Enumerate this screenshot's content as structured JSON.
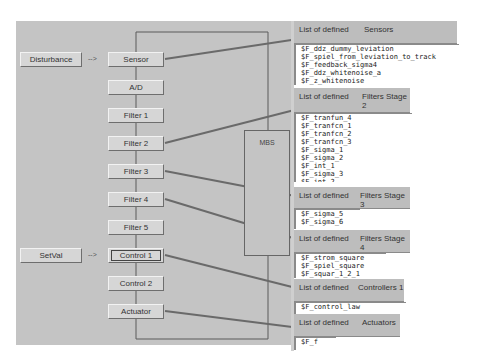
{
  "left_inputs": [
    {
      "label": "Disturbance",
      "arrow": "-->",
      "row": 0
    },
    {
      "label": "SetVal",
      "arrow": "-->",
      "row": 7
    }
  ],
  "chain": [
    {
      "label": "Sensor"
    },
    {
      "label": "A/D"
    },
    {
      "label": "Filter 1"
    },
    {
      "label": "Filter 2"
    },
    {
      "label": "Filter 3"
    },
    {
      "label": "Filter 4"
    },
    {
      "label": "Filter 5"
    },
    {
      "label": "Control 1",
      "focused": true
    },
    {
      "label": "Control 2"
    },
    {
      "label": "Actuator"
    }
  ],
  "mbs": {
    "label": "MBS"
  },
  "panels": [
    {
      "prefix": "List of defined",
      "category": "Sensors",
      "items": [
        "$F_ddz_dummy_leviation",
        "$F_spiel_from_leviation_to_track",
        "$F_feedback_sigma4",
        "$F_ddz_whitenoise_a",
        "$F_z_whitenoise"
      ]
    },
    {
      "prefix": "List of defined",
      "category": "Filters Stage 2",
      "items": [
        "$F_tranfun_4",
        "$F_tranfcn_1",
        "$F_tranfcn_2",
        "$F_tranfcn_3",
        "$F_sigma_1",
        "$F_sigma_2",
        "$F_int_1",
        "$F_sigma_3",
        "$F_int_2"
      ]
    },
    {
      "prefix": "List of defined",
      "category": "Filters Stage 3",
      "items": [
        "$F_sigma_5",
        "$F_sigma_6"
      ]
    },
    {
      "prefix": "List of defined",
      "category": "Filters Stage 4",
      "items": [
        "$F_strom_square",
        "$F_spiel_square",
        "$F_squar_1_2_1"
      ]
    },
    {
      "prefix": "List of defined",
      "category": "Controllers 1",
      "items": [
        "$F_control_law"
      ]
    },
    {
      "prefix": "List of defined",
      "category": "Actuators",
      "items": [
        "$F_f"
      ]
    }
  ]
}
